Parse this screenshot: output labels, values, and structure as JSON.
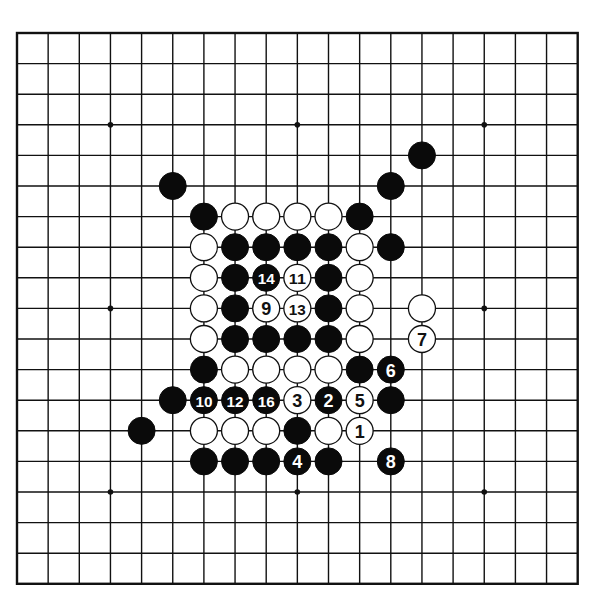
{
  "board": {
    "size": 19,
    "origin_x": 17,
    "origin_y": 33,
    "spacing_x": 31.15,
    "spacing_y": 30.6,
    "stone_radius": 13.5,
    "star_points": [
      [
        3,
        3
      ],
      [
        9,
        3
      ],
      [
        15,
        3
      ],
      [
        3,
        9
      ],
      [
        9,
        9
      ],
      [
        15,
        9
      ],
      [
        3,
        15
      ],
      [
        9,
        15
      ],
      [
        15,
        15
      ]
    ],
    "colors": {
      "line": "#111111",
      "black": "#0a0a0a",
      "white": "#ffffff",
      "background": "#ffffff"
    }
  },
  "stones": [
    {
      "c": 13,
      "r": 4,
      "color": "black",
      "label": ""
    },
    {
      "c": 5,
      "r": 5,
      "color": "black",
      "label": ""
    },
    {
      "c": 12,
      "r": 5,
      "color": "black",
      "label": ""
    },
    {
      "c": 6,
      "r": 6,
      "color": "black",
      "label": ""
    },
    {
      "c": 7,
      "r": 6,
      "color": "white",
      "label": ""
    },
    {
      "c": 8,
      "r": 6,
      "color": "white",
      "label": ""
    },
    {
      "c": 9,
      "r": 6,
      "color": "white",
      "label": ""
    },
    {
      "c": 10,
      "r": 6,
      "color": "white",
      "label": ""
    },
    {
      "c": 11,
      "r": 6,
      "color": "black",
      "label": ""
    },
    {
      "c": 6,
      "r": 7,
      "color": "white",
      "label": ""
    },
    {
      "c": 7,
      "r": 7,
      "color": "black",
      "label": ""
    },
    {
      "c": 8,
      "r": 7,
      "color": "black",
      "label": ""
    },
    {
      "c": 9,
      "r": 7,
      "color": "black",
      "label": ""
    },
    {
      "c": 10,
      "r": 7,
      "color": "black",
      "label": ""
    },
    {
      "c": 11,
      "r": 7,
      "color": "white",
      "label": ""
    },
    {
      "c": 12,
      "r": 7,
      "color": "black",
      "label": ""
    },
    {
      "c": 6,
      "r": 8,
      "color": "white",
      "label": ""
    },
    {
      "c": 7,
      "r": 8,
      "color": "black",
      "label": ""
    },
    {
      "c": 8,
      "r": 8,
      "color": "black",
      "label": "14"
    },
    {
      "c": 9,
      "r": 8,
      "color": "white",
      "label": "11"
    },
    {
      "c": 10,
      "r": 8,
      "color": "black",
      "label": ""
    },
    {
      "c": 11,
      "r": 8,
      "color": "white",
      "label": ""
    },
    {
      "c": 6,
      "r": 9,
      "color": "white",
      "label": ""
    },
    {
      "c": 7,
      "r": 9,
      "color": "black",
      "label": ""
    },
    {
      "c": 8,
      "r": 9,
      "color": "white",
      "label": "9"
    },
    {
      "c": 9,
      "r": 9,
      "color": "white",
      "label": "13"
    },
    {
      "c": 10,
      "r": 9,
      "color": "black",
      "label": ""
    },
    {
      "c": 11,
      "r": 9,
      "color": "white",
      "label": ""
    },
    {
      "c": 13,
      "r": 9,
      "color": "white",
      "label": ""
    },
    {
      "c": 6,
      "r": 10,
      "color": "white",
      "label": ""
    },
    {
      "c": 7,
      "r": 10,
      "color": "black",
      "label": ""
    },
    {
      "c": 8,
      "r": 10,
      "color": "black",
      "label": ""
    },
    {
      "c": 9,
      "r": 10,
      "color": "black",
      "label": ""
    },
    {
      "c": 10,
      "r": 10,
      "color": "black",
      "label": ""
    },
    {
      "c": 11,
      "r": 10,
      "color": "white",
      "label": ""
    },
    {
      "c": 13,
      "r": 10,
      "color": "white",
      "label": "7"
    },
    {
      "c": 6,
      "r": 11,
      "color": "black",
      "label": ""
    },
    {
      "c": 7,
      "r": 11,
      "color": "white",
      "label": ""
    },
    {
      "c": 8,
      "r": 11,
      "color": "white",
      "label": ""
    },
    {
      "c": 9,
      "r": 11,
      "color": "white",
      "label": ""
    },
    {
      "c": 10,
      "r": 11,
      "color": "white",
      "label": ""
    },
    {
      "c": 11,
      "r": 11,
      "color": "black",
      "label": ""
    },
    {
      "c": 12,
      "r": 11,
      "color": "black",
      "label": "6"
    },
    {
      "c": 5,
      "r": 12,
      "color": "black",
      "label": ""
    },
    {
      "c": 6,
      "r": 12,
      "color": "black",
      "label": "10"
    },
    {
      "c": 7,
      "r": 12,
      "color": "black",
      "label": "12"
    },
    {
      "c": 8,
      "r": 12,
      "color": "black",
      "label": "16"
    },
    {
      "c": 9,
      "r": 12,
      "color": "white",
      "label": "3"
    },
    {
      "c": 10,
      "r": 12,
      "color": "black",
      "label": "2"
    },
    {
      "c": 11,
      "r": 12,
      "color": "white",
      "label": "5"
    },
    {
      "c": 12,
      "r": 12,
      "color": "black",
      "label": ""
    },
    {
      "c": 4,
      "r": 13,
      "color": "black",
      "label": ""
    },
    {
      "c": 6,
      "r": 13,
      "color": "white",
      "label": ""
    },
    {
      "c": 7,
      "r": 13,
      "color": "white",
      "label": ""
    },
    {
      "c": 8,
      "r": 13,
      "color": "white",
      "label": ""
    },
    {
      "c": 9,
      "r": 13,
      "color": "black",
      "label": ""
    },
    {
      "c": 10,
      "r": 13,
      "color": "white",
      "label": ""
    },
    {
      "c": 11,
      "r": 13,
      "color": "white",
      "label": "1"
    },
    {
      "c": 6,
      "r": 14,
      "color": "black",
      "label": ""
    },
    {
      "c": 7,
      "r": 14,
      "color": "black",
      "label": ""
    },
    {
      "c": 8,
      "r": 14,
      "color": "black",
      "label": ""
    },
    {
      "c": 9,
      "r": 14,
      "color": "black",
      "label": "4"
    },
    {
      "c": 10,
      "r": 14,
      "color": "black",
      "label": ""
    },
    {
      "c": 12,
      "r": 14,
      "color": "black",
      "label": "8"
    }
  ]
}
